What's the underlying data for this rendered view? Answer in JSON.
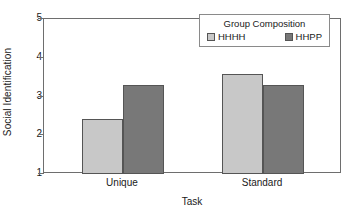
{
  "chart_data": {
    "type": "bar",
    "title": "",
    "xlabel": "Task",
    "ylabel": "Social Identification",
    "categories": [
      "Unique",
      "Standard"
    ],
    "ylim": [
      1,
      5
    ],
    "yticks": [
      1,
      2,
      3,
      4,
      5
    ],
    "ytick_labels": [
      "1",
      "2",
      "3",
      "4",
      "5"
    ],
    "grid": false,
    "legend": {
      "title": "Group  Composition",
      "position": "top-right",
      "entries": [
        {
          "label": "HHHH",
          "color": "#c8c8c8"
        },
        {
          "label": "HHPP",
          "color": "#787878"
        }
      ]
    },
    "series": [
      {
        "name": "HHHH",
        "color": "#c8c8c8",
        "values": [
          2.42,
          3.58
        ]
      },
      {
        "name": "HHPP",
        "color": "#787878",
        "values": [
          3.3,
          3.3
        ]
      }
    ]
  }
}
